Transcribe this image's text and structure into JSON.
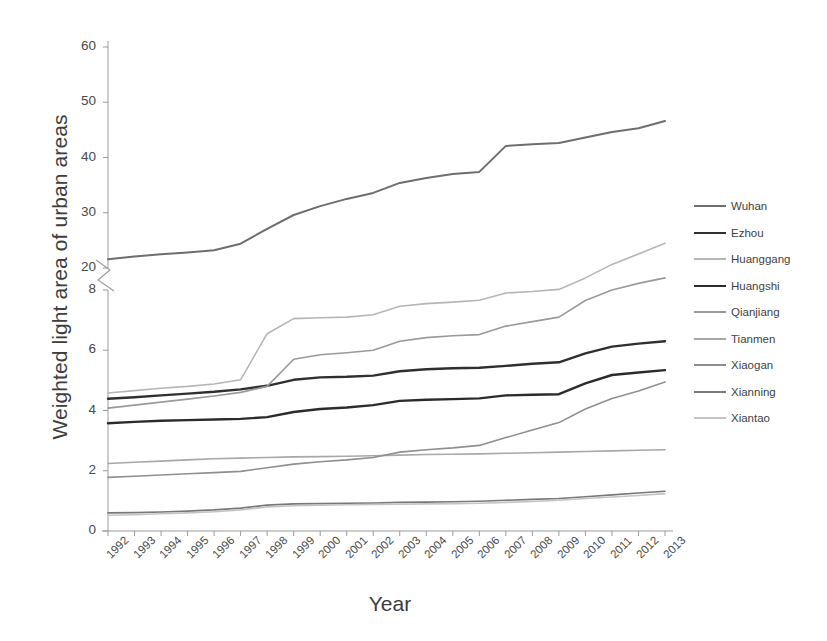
{
  "chart_data": {
    "type": "line",
    "title": "",
    "xlabel": "Year",
    "ylabel": "Weighted light area of urban areas",
    "grid": false,
    "legend_position": "right",
    "axis_break": true,
    "y_lower_segment": [
      0,
      8
    ],
    "y_upper_segment": [
      20,
      60
    ],
    "yticks_lower": [
      0,
      2,
      4,
      6,
      8
    ],
    "yticks_upper": [
      20,
      30,
      40,
      50,
      60
    ],
    "x": [
      1992,
      1993,
      1994,
      1995,
      1996,
      1997,
      1998,
      1999,
      2000,
      2001,
      2002,
      2003,
      2004,
      2005,
      2006,
      2007,
      2008,
      2009,
      2010,
      2011,
      2012,
      2013
    ],
    "categories": [
      "1992",
      "1993",
      "1994",
      "1995",
      "1996",
      "1997",
      "1998",
      "1999",
      "2000",
      "2001",
      "2002",
      "2003",
      "2004",
      "2005",
      "2006",
      "2007",
      "2008",
      "2009",
      "2010",
      "2011",
      "2012",
      "2013"
    ],
    "series": [
      {
        "name": "Wuhan",
        "color": "#6e6e6e",
        "width": 2.0,
        "values": [
          21.6,
          22.1,
          22.5,
          22.8,
          23.2,
          24.4,
          27.1,
          29.6,
          31.2,
          32.5,
          33.6,
          35.4,
          36.3,
          37.0,
          37.4,
          42.1,
          42.4,
          42.6,
          43.6,
          44.6,
          45.3,
          46.6
        ]
      },
      {
        "name": "Ezhou",
        "color": "#2f2f2f",
        "width": 2.4,
        "values": [
          4.39,
          4.44,
          4.5,
          4.56,
          4.62,
          4.7,
          4.82,
          5.02,
          5.1,
          5.12,
          5.16,
          5.3,
          5.37,
          5.4,
          5.42,
          5.48,
          5.55,
          5.6,
          5.9,
          6.12,
          6.22,
          6.3
        ]
      },
      {
        "name": "Huanggang",
        "color": "#b6b6b6",
        "width": 1.6,
        "values": [
          4.58,
          4.66,
          4.74,
          4.8,
          4.88,
          5.02,
          6.55,
          7.05,
          7.08,
          7.1,
          7.18,
          7.46,
          7.55,
          7.6,
          7.66,
          7.9,
          7.95,
          8.02,
          8.4,
          8.85,
          9.2,
          9.55
        ]
      },
      {
        "name": "Huangshi",
        "color": "#2b2b2b",
        "width": 2.4,
        "values": [
          3.58,
          3.62,
          3.66,
          3.68,
          3.7,
          3.72,
          3.78,
          3.95,
          4.05,
          4.1,
          4.18,
          4.32,
          4.36,
          4.38,
          4.4,
          4.5,
          4.52,
          4.54,
          4.9,
          5.18,
          5.26,
          5.34
        ]
      },
      {
        "name": "Qianjiang",
        "color": "#9a9a9a",
        "width": 1.6,
        "values": [
          4.08,
          4.18,
          4.28,
          4.38,
          4.48,
          4.6,
          4.8,
          5.7,
          5.85,
          5.92,
          6.0,
          6.3,
          6.42,
          6.48,
          6.52,
          6.8,
          6.95,
          7.1,
          7.65,
          8.0,
          8.22,
          8.4
        ]
      },
      {
        "name": "Tianmen",
        "color": "#a8a8a8",
        "width": 1.6,
        "values": [
          2.24,
          2.28,
          2.32,
          2.36,
          2.4,
          2.42,
          2.44,
          2.46,
          2.47,
          2.48,
          2.5,
          2.52,
          2.54,
          2.55,
          2.56,
          2.58,
          2.6,
          2.62,
          2.64,
          2.66,
          2.68,
          2.7
        ]
      },
      {
        "name": "Xiaogan",
        "color": "#8f8f8f",
        "width": 1.6,
        "values": [
          1.78,
          1.82,
          1.86,
          1.9,
          1.94,
          1.98,
          2.1,
          2.22,
          2.3,
          2.36,
          2.44,
          2.62,
          2.7,
          2.76,
          2.84,
          3.1,
          3.35,
          3.6,
          4.05,
          4.4,
          4.65,
          4.95
        ]
      },
      {
        "name": "Xianning",
        "color": "#787878",
        "width": 1.6,
        "values": [
          0.6,
          0.61,
          0.63,
          0.66,
          0.7,
          0.76,
          0.86,
          0.9,
          0.91,
          0.92,
          0.93,
          0.95,
          0.96,
          0.97,
          0.99,
          1.02,
          1.05,
          1.08,
          1.14,
          1.2,
          1.26,
          1.32
        ]
      },
      {
        "name": "Xiantao",
        "color": "#c4c4c4",
        "width": 1.6,
        "values": [
          0.52,
          0.54,
          0.57,
          0.6,
          0.64,
          0.7,
          0.8,
          0.84,
          0.86,
          0.87,
          0.88,
          0.89,
          0.9,
          0.91,
          0.92,
          0.95,
          0.98,
          1.02,
          1.08,
          1.13,
          1.18,
          1.24
        ]
      }
    ]
  },
  "axes": {
    "y_title": "Weighted light area of urban areas",
    "x_title": "Year"
  },
  "legend": {
    "items": [
      {
        "label": "Wuhan"
      },
      {
        "label": "Ezhou"
      },
      {
        "label": "Huanggang"
      },
      {
        "label": "Huangshi"
      },
      {
        "label": "Qianjiang"
      },
      {
        "label": "Tianmen"
      },
      {
        "label": "Xiaogan"
      },
      {
        "label": "Xianning"
      },
      {
        "label": "Xiantao"
      }
    ]
  },
  "caption": {
    "text": "",
    "fragment_visible": true
  }
}
